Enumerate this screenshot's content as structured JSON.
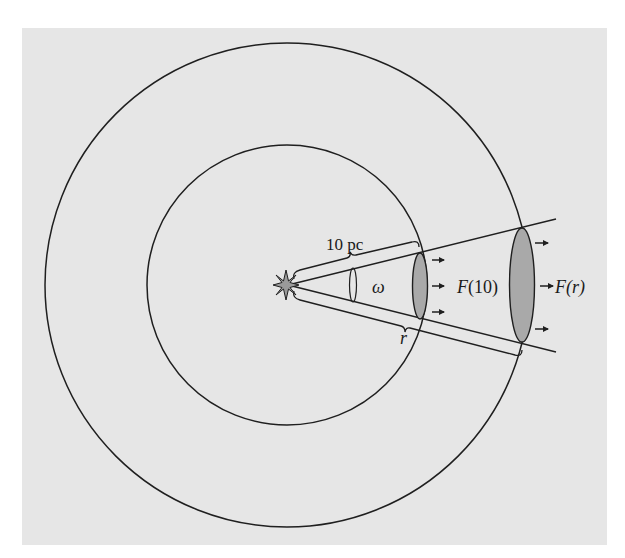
{
  "diagram": {
    "type": "inverse-square-law-flux-geometry",
    "background_color": "#e6e6e6",
    "line_color": "#1f1f1f",
    "ellipse_fill": "#a9a9a9",
    "labels": {
      "distance_10pc": "10 pc",
      "solid_angle": "ω",
      "flux_at_10": "F(10)",
      "flux_at_r": "F(r)",
      "radius": "r"
    },
    "elements": {
      "star": "point light source at shared center",
      "inner_sphere": "sphere of radius 10 pc",
      "outer_sphere": "sphere of radius r",
      "cone": "cone of solid angle ω from star",
      "small_patch": "area intercepted at 10 pc",
      "large_patch": "area intercepted at r",
      "arrows_small": 3,
      "arrows_large": 3
    }
  }
}
